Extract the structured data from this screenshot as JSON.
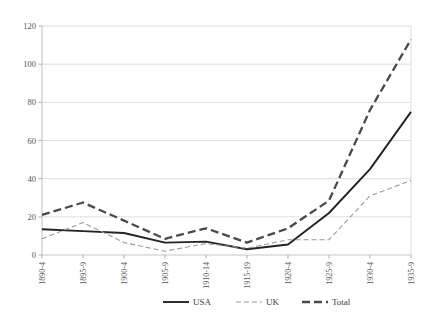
{
  "chart_data": {
    "type": "line",
    "title": "",
    "subtitle": "",
    "xlabel": "",
    "ylabel": "",
    "ylim": [
      0,
      120
    ],
    "yticks": [
      0,
      20,
      40,
      60,
      80,
      100,
      120
    ],
    "ytick_labels": [
      "0",
      "20",
      "40",
      "60",
      "80",
      "100",
      "120"
    ],
    "grid": true,
    "grid_axis": "y",
    "legend_position": "bottom",
    "categories": [
      "1890-4",
      "1895-9",
      "1900-4",
      "1905-9",
      "1910-14",
      "1915-19",
      "1920-4",
      "1925-9",
      "1930-4",
      "1935-9"
    ],
    "series": [
      {
        "name": "USA",
        "style": "solid",
        "color": "#222222",
        "values": [
          13.5,
          12.5,
          11.5,
          6.5,
          7.0,
          3.0,
          5.5,
          22.0,
          45.0,
          75.0
        ]
      },
      {
        "name": "UK",
        "style": "dashed-thin",
        "color": "#9a9a9a",
        "values": [
          8.5,
          17.0,
          6.5,
          2.0,
          6.0,
          3.5,
          8.0,
          8.0,
          31.0,
          39.0
        ]
      },
      {
        "name": "Total",
        "style": "dashed-thick",
        "color": "#4a4a4a",
        "values": [
          21.0,
          27.5,
          18.0,
          8.5,
          14.0,
          6.5,
          14.0,
          28.5,
          76.0,
          113.0
        ]
      }
    ]
  },
  "legend": {
    "items": [
      {
        "label": "USA",
        "swatch": "solid-line-swatch"
      },
      {
        "label": "UK",
        "swatch": "dashed-thin-line-swatch"
      },
      {
        "label": "Total",
        "swatch": "dashed-thick-line-swatch"
      }
    ]
  },
  "axes": {
    "y_axis_name": "value-axis",
    "x_axis_name": "period-axis"
  }
}
